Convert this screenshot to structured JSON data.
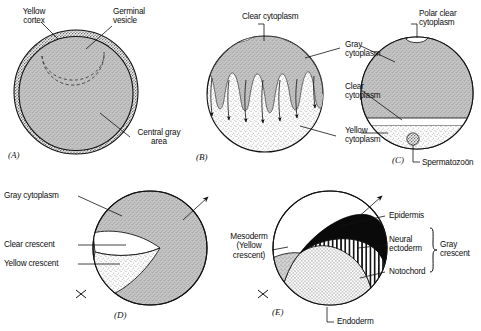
{
  "figure": {
    "type": "biological-diagram",
    "panel_count": 5
  },
  "panels": [
    {
      "id": "(A)",
      "name": "unfertilized-egg",
      "labels": [
        {
          "key": "yellow_cortex",
          "text": "Yellow\ncortex"
        },
        {
          "key": "germinal_vesicle",
          "text": "Germinal\nvesicle"
        },
        {
          "key": "central_gray_area",
          "text": "Central gray\narea"
        }
      ]
    },
    {
      "id": "(B)",
      "name": "cytoplasmic-streaming",
      "labels": [
        {
          "key": "clear_cytoplasm_top",
          "text": "Clear cytoplasm"
        },
        {
          "key": "gray_cytoplasm",
          "text": "Gray\ncytoplasm"
        },
        {
          "key": "clear_cytoplasm",
          "text": "Clear\ncytoplasm"
        },
        {
          "key": "yellow_cytoplasm",
          "text": "Yellow\ncytoplasm"
        }
      ]
    },
    {
      "id": "(C)",
      "name": "fertilized-egg",
      "labels": [
        {
          "key": "polar_clear_cytoplasm",
          "text": "Polar clear\ncytoplasm"
        },
        {
          "key": "spermatozoon",
          "text": "Spermatozoön"
        }
      ]
    },
    {
      "id": "(D)",
      "name": "gray-crescent-formation",
      "labels": [
        {
          "key": "gray_cytoplasm",
          "text": "Gray cytoplasm"
        },
        {
          "key": "clear_crescent",
          "text": "Clear crescent"
        },
        {
          "key": "yellow_crescent",
          "text": "Yellow crescent"
        }
      ]
    },
    {
      "id": "(E)",
      "name": "fate-map",
      "labels": [
        {
          "key": "mesoderm",
          "text": "Mesoderm\n(Yellow\ncrescent)"
        },
        {
          "key": "epidermis",
          "text": "Epidermis"
        },
        {
          "key": "neural_ectoderm",
          "text": "Neural\nectoderm"
        },
        {
          "key": "notochord",
          "text": "Notochord"
        },
        {
          "key": "gray_crescent",
          "text": "Gray\ncrescent"
        },
        {
          "key": "endoderm",
          "text": "Endoderm"
        }
      ]
    }
  ],
  "labels": {
    "a_yellow_cortex": "Yellow\ncortex",
    "a_germinal_vesicle": "Germinal\nvesicle",
    "a_central_gray_area": "Central gray\narea",
    "a_panel_id": "(A)",
    "b_clear_cytoplasm_top": "Clear cytoplasm",
    "b_gray_cytoplasm": "Gray\ncytoplasm",
    "b_clear_cytoplasm": "Clear\ncytoplasm",
    "b_yellow_cytoplasm": "Yellow\ncytoplasm",
    "b_panel_id": "(B)",
    "c_polar_clear_cytoplasm": "Polar clear\ncytoplasm",
    "c_spermatozoon": "Spermatozoön",
    "c_panel_id": "(C)",
    "d_gray_cytoplasm": "Gray cytoplasm",
    "d_clear_crescent": "Clear crescent",
    "d_yellow_crescent": "Yellow crescent",
    "d_panel_id": "(D)",
    "e_mesoderm": "Mesoderm\n(Yellow\ncrescent)",
    "e_epidermis": "Epidermis",
    "e_neural_ectoderm": "Neural\nectoderm",
    "e_notochord": "Notochord",
    "e_gray_crescent": "Gray\ncrescent",
    "e_endoderm": "Endoderm",
    "e_panel_id": "(E)"
  },
  "colors": {
    "background": "#ffffff",
    "outline": "#111111",
    "gray_cytoplasm": "#b9b9b9",
    "gray_cytoplasm_dark": "#a8a8a8",
    "yellow_stipple": "#e8e8e8",
    "clear": "#ffffff",
    "black_region": "#0a0a0a",
    "mesoderm_gray": "#c2c2c2",
    "text": "#0d0d0d"
  }
}
